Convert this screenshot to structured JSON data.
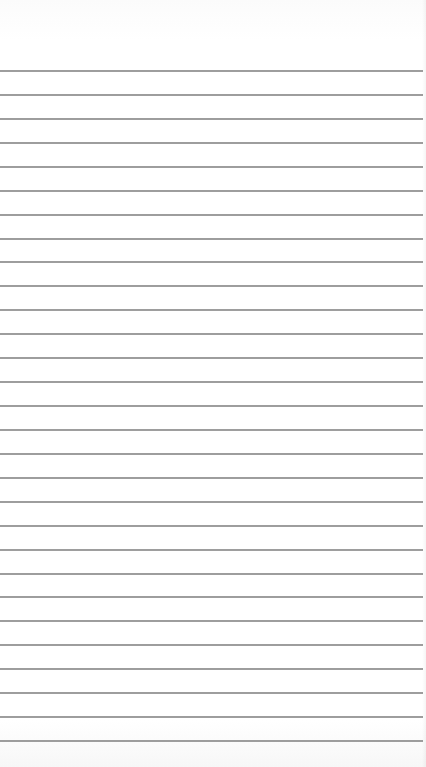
{
  "page": {
    "type": "lined-notepad-page",
    "background_color": "#ffffff",
    "line_color": "#9d9d9d",
    "line_count": 29,
    "first_line_y": 70,
    "line_spacing": 23.93,
    "line_width": 423
  }
}
